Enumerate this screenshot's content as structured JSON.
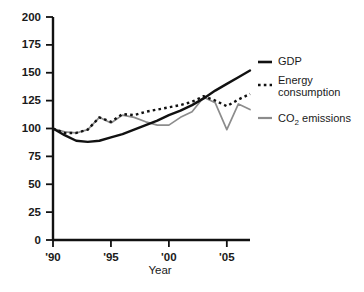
{
  "chart_data": {
    "type": "line",
    "title": "",
    "xlabel": "Year",
    "ylabel": "",
    "xlim": [
      1990,
      2007
    ],
    "ylim": [
      0,
      200
    ],
    "grid": false,
    "legend_position": "right",
    "y_ticks": [
      0,
      25,
      50,
      75,
      100,
      125,
      150,
      175,
      200
    ],
    "y_tick_labels": [
      "0",
      "25",
      "50",
      "75",
      "100",
      "125",
      "150",
      "175",
      "200"
    ],
    "x_ticks": [
      1990,
      1995,
      2000,
      2005
    ],
    "x_tick_labels": [
      "'90",
      "'95",
      "'00",
      "'05"
    ],
    "x": [
      1990,
      1991,
      1992,
      1993,
      1994,
      1995,
      1996,
      1997,
      1998,
      1999,
      2000,
      2001,
      2002,
      2003,
      2004,
      2005,
      2006,
      2007
    ],
    "series": [
      {
        "name": "GDP",
        "style": "solid",
        "color": "#111111",
        "values": [
          100,
          94,
          89,
          88,
          89,
          92,
          95,
          99,
          103,
          107,
          112,
          116,
          121,
          127,
          134,
          140,
          146,
          152
        ]
      },
      {
        "name": "Energy consumption",
        "style": "dashed",
        "color": "#111111",
        "values": [
          100,
          96,
          96,
          99,
          110,
          106,
          113,
          112,
          115,
          117,
          119,
          121,
          124,
          129,
          125,
          120,
          126,
          131
        ]
      },
      {
        "name": "CO2 emissions",
        "style": "solid",
        "color": "#8c8c8c",
        "values": [
          100,
          97,
          96,
          99,
          110,
          105,
          112,
          110,
          106,
          103,
          103,
          110,
          115,
          128,
          123,
          99,
          122,
          117
        ]
      }
    ]
  },
  "legend": {
    "items": [
      {
        "label": "GDP",
        "label2": "",
        "marker": "solid-black-dash"
      },
      {
        "label": "Energy",
        "label2": "consumption",
        "marker": "dotted-black-dash"
      },
      {
        "label": "CO",
        "label_sub": "2",
        "label_tail": " emissions",
        "marker": "solid-gray-dash"
      }
    ]
  },
  "axis": {
    "x_title": "Year"
  }
}
